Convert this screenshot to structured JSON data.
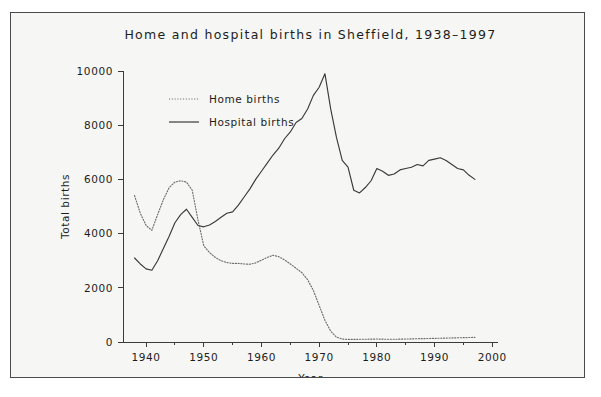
{
  "figure": {
    "background_color": "#f6f6f4",
    "frame_color": "#4a4a4a",
    "page_color": "#ffffff"
  },
  "chart_data": {
    "type": "line",
    "title": "Home and hospital births in Sheffield, 1938–1997",
    "xlabel": "Year",
    "ylabel": "Total births",
    "xlim": [
      1936,
      2001
    ],
    "ylim": [
      0,
      10000
    ],
    "xticks": [
      1940,
      1950,
      1960,
      1970,
      1980,
      1990,
      2000
    ],
    "xticklabels": [
      "1940",
      "1950",
      "1960",
      "1970",
      "1980",
      "1990",
      "2000"
    ],
    "xminorticks": [
      1945,
      1955,
      1965,
      1975,
      1985,
      1995
    ],
    "yticks": [
      0,
      2000,
      4000,
      6000,
      8000,
      10000
    ],
    "yticklabels": [
      "0",
      "2000",
      "4000",
      "6000",
      "8000",
      "10000"
    ],
    "grid": false,
    "legend_position": "upper-left-inside",
    "series": [
      {
        "name": "Home births",
        "style": "dotted",
        "color": "#6d6d6d",
        "x": [
          1938,
          1939,
          1940,
          1941,
          1942,
          1943,
          1944,
          1945,
          1946,
          1947,
          1948,
          1949,
          1950,
          1951,
          1952,
          1953,
          1954,
          1955,
          1956,
          1957,
          1958,
          1959,
          1960,
          1961,
          1962,
          1963,
          1964,
          1965,
          1966,
          1967,
          1968,
          1969,
          1970,
          1971,
          1972,
          1973,
          1974,
          1975,
          1976,
          1977,
          1978,
          1979,
          1980,
          1981,
          1982,
          1983,
          1984,
          1985,
          1986,
          1987,
          1988,
          1989,
          1990,
          1991,
          1992,
          1993,
          1994,
          1995,
          1996,
          1997
        ],
        "values": [
          5400,
          4750,
          4300,
          4120,
          4700,
          5250,
          5700,
          5900,
          5950,
          5900,
          5600,
          4500,
          3550,
          3300,
          3120,
          3000,
          2930,
          2900,
          2900,
          2880,
          2870,
          2920,
          3020,
          3120,
          3200,
          3150,
          3030,
          2880,
          2720,
          2560,
          2300,
          1900,
          1350,
          800,
          400,
          180,
          110,
          95,
          95,
          100,
          100,
          105,
          110,
          105,
          100,
          100,
          105,
          110,
          115,
          120,
          125,
          130,
          135,
          140,
          145,
          150,
          155,
          160,
          165,
          170
        ]
      },
      {
        "name": "Hospital births",
        "style": "solid",
        "color": "#3a3a3a",
        "x": [
          1938,
          1939,
          1940,
          1941,
          1942,
          1943,
          1944,
          1945,
          1946,
          1947,
          1948,
          1949,
          1950,
          1951,
          1952,
          1953,
          1954,
          1955,
          1956,
          1957,
          1958,
          1959,
          1960,
          1961,
          1962,
          1963,
          1964,
          1965,
          1966,
          1967,
          1968,
          1969,
          1970,
          1971,
          1972,
          1973,
          1974,
          1975,
          1976,
          1977,
          1978,
          1979,
          1980,
          1981,
          1982,
          1983,
          1984,
          1985,
          1986,
          1987,
          1988,
          1989,
          1990,
          1991,
          1992,
          1993,
          1994,
          1995,
          1996,
          1997
        ],
        "values": [
          3100,
          2880,
          2700,
          2650,
          3000,
          3450,
          3900,
          4400,
          4700,
          4900,
          4600,
          4300,
          4250,
          4320,
          4450,
          4600,
          4750,
          4800,
          5050,
          5350,
          5650,
          6000,
          6300,
          6600,
          6900,
          7150,
          7500,
          7750,
          8100,
          8250,
          8600,
          9100,
          9400,
          9900,
          8600,
          7550,
          6700,
          6450,
          5600,
          5500,
          5700,
          5950,
          6400,
          6300,
          6150,
          6200,
          6350,
          6400,
          6450,
          6550,
          6500,
          6700,
          6750,
          6800,
          6700,
          6550,
          6400,
          6350,
          6150,
          6000
        ]
      }
    ]
  }
}
